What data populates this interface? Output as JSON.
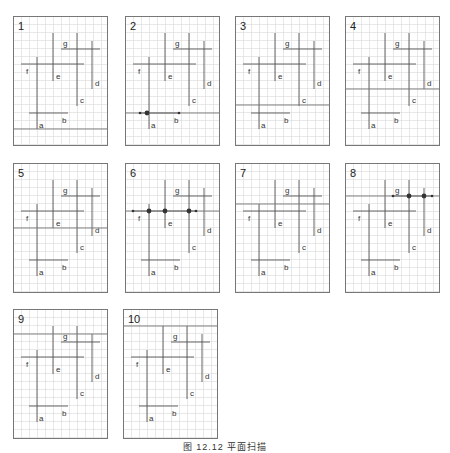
{
  "figure": {
    "caption": "图 12.12   平面扫描",
    "grid": {
      "cell": 8,
      "width": 95,
      "height": 130,
      "line_color": "#d9d9d9",
      "border_color": "#777777"
    },
    "segment_color": "#555555",
    "sweep_color": "#777777",
    "segments": [
      {
        "label": "a",
        "orient": "v",
        "x": 24,
        "y1": 41,
        "y2": 113,
        "lx": 26,
        "ly": 112
      },
      {
        "label": "b",
        "orient": "h",
        "y": 97,
        "x1": 16,
        "x2": 55,
        "lx": 49,
        "ly": 107
      },
      {
        "label": "c",
        "orient": "v",
        "x": 64,
        "y1": 17,
        "y2": 90,
        "lx": 67,
        "ly": 87
      },
      {
        "label": "d",
        "orient": "v",
        "x": 79,
        "y1": 25,
        "y2": 73,
        "lx": 82,
        "ly": 70
      },
      {
        "label": "e",
        "orient": "v",
        "x": 40,
        "y1": 17,
        "y2": 65,
        "lx": 43,
        "ly": 63
      },
      {
        "label": "f",
        "orient": "h",
        "y": 48,
        "x1": 8,
        "x2": 71,
        "lx": 13,
        "ly": 58
      },
      {
        "label": "g",
        "orient": "h",
        "y": 33,
        "x1": 48,
        "x2": 87,
        "lx": 50,
        "ly": 30
      }
    ],
    "panels": [
      {
        "number": "1",
        "x": 13,
        "y": 16,
        "sweep_y": 113,
        "dots": []
      },
      {
        "number": "2",
        "x": 125,
        "y": 16,
        "sweep_y": 97,
        "dots": [
          {
            "x": 15,
            "r": 1.3
          },
          {
            "x": 22,
            "r": 2.4
          },
          {
            "x": 54,
            "r": 1.3
          }
        ]
      },
      {
        "number": "3",
        "x": 235,
        "y": 16,
        "sweep_y": 89,
        "dots": []
      },
      {
        "number": "4",
        "x": 345,
        "y": 16,
        "sweep_y": 73,
        "dots": []
      },
      {
        "number": "5",
        "x": 13,
        "y": 163,
        "sweep_y": 65,
        "dots": []
      },
      {
        "number": "6",
        "x": 125,
        "y": 163,
        "sweep_y": 48,
        "dots": [
          {
            "x": 8,
            "r": 1.3
          },
          {
            "x": 24,
            "r": 2.4
          },
          {
            "x": 40,
            "r": 2.4
          },
          {
            "x": 64,
            "r": 2.4
          },
          {
            "x": 71,
            "r": 1.3
          }
        ]
      },
      {
        "number": "7",
        "x": 235,
        "y": 163,
        "sweep_y": 41,
        "dots": []
      },
      {
        "number": "8",
        "x": 345,
        "y": 163,
        "sweep_y": 33,
        "dots": [
          {
            "x": 48,
            "r": 1.3
          },
          {
            "x": 64,
            "r": 2.4
          },
          {
            "x": 79,
            "r": 2.4
          },
          {
            "x": 87,
            "r": 1.3
          }
        ]
      },
      {
        "number": "9",
        "x": 13,
        "y": 309,
        "sweep_y": 25,
        "dots": []
      },
      {
        "number": "10",
        "x": 123,
        "y": 309,
        "sweep_y": 17,
        "dots": []
      }
    ]
  }
}
